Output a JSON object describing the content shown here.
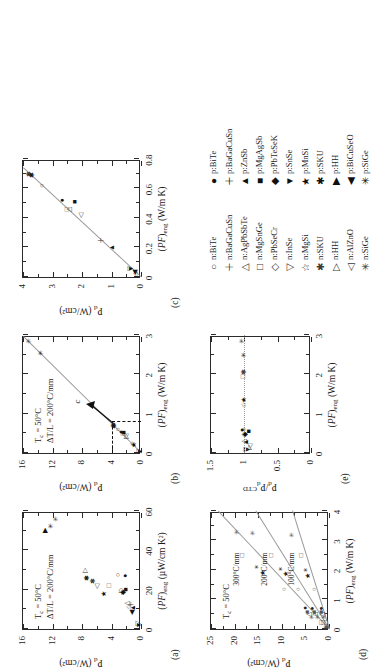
{
  "figure": {
    "caption_panels": [
      "(a)",
      "(b)",
      "(c)",
      "(d)",
      "(e)"
    ]
  },
  "legend": {
    "n_type": [
      {
        "label": "n:BiTe",
        "marker": "circle-open"
      },
      {
        "label": "n:BaGaCuSn",
        "marker": "plus-open"
      },
      {
        "label": "n:AgPbSbTe",
        "marker": "triangle-up-open"
      },
      {
        "label": "n:MgSnGe",
        "marker": "square-open"
      },
      {
        "label": "n:PbSeCr",
        "marker": "diamond-open"
      },
      {
        "label": "n:InSe",
        "marker": "triangle-down-open"
      },
      {
        "label": "n:MgSi",
        "marker": "star5-open"
      },
      {
        "label": "n:SKU",
        "marker": "asterisk-open"
      },
      {
        "label": "n:HH",
        "marker": "triangle-right-open"
      },
      {
        "label": "n:AlZnO",
        "marker": "triangle-left-open"
      },
      {
        "label": "n:SiGe",
        "marker": "star6-open"
      }
    ],
    "p_type": [
      {
        "label": "p:BiTe",
        "marker": "circle-filled"
      },
      {
        "label": "p:BaGaCuSn",
        "marker": "plus-filled"
      },
      {
        "label": "p:ZnSb",
        "marker": "triangle-up-filled"
      },
      {
        "label": "p:MgAgSb",
        "marker": "square-filled"
      },
      {
        "label": "p:PbTeSeK",
        "marker": "diamond-filled"
      },
      {
        "label": "p:SnSe",
        "marker": "triangle-down-filled"
      },
      {
        "label": "p:MnSi",
        "marker": "star5-filled"
      },
      {
        "label": "p:SKU",
        "marker": "asterisk-filled"
      },
      {
        "label": "p:HH",
        "marker": "triangle-right-filled"
      },
      {
        "label": "p:BiCuSeO",
        "marker": "triangle-left-filled"
      },
      {
        "label": "p:SiGe",
        "marker": "star6-filled"
      }
    ]
  },
  "chart_data": [
    {
      "id": "a",
      "panel": "(a)",
      "type": "scatter",
      "title": "",
      "xlabel": "(PF)eng (µW/cm K²)",
      "ylabel": "Pd (W/cm²)",
      "xlabel_parts": {
        "italic": "PF",
        "sub": "eng",
        "unit": "(µW/cm K²)"
      },
      "ylabel_parts": {
        "italic": "P",
        "sub": "d",
        "unit": "(W/cm²)"
      },
      "xlim": [
        0,
        60
      ],
      "ylim": [
        0,
        16
      ],
      "xticks": [
        0,
        20,
        40,
        60
      ],
      "yticks": [
        0,
        4,
        8,
        12,
        16
      ],
      "grid": false,
      "annotations": [
        "Tc = 50°C",
        "ΔT/L = 200°C/mm"
      ],
      "points": [
        {
          "name": "n:BiTe",
          "x": 27.5,
          "y": 3.1,
          "marker": "circle-open"
        },
        {
          "name": "p:BiTe",
          "x": 27.0,
          "y": 2.2,
          "marker": "circle-filled"
        },
        {
          "name": "n:BaGaCuSn",
          "x": 12.5,
          "y": 1.3,
          "marker": "plus-open"
        },
        {
          "name": "p:BaGaCuSn",
          "x": 18.5,
          "y": 2.6,
          "marker": "plus-filled"
        },
        {
          "name": "n:AgPbSbTe",
          "x": 13.0,
          "y": 1.9,
          "marker": "triangle-up-open"
        },
        {
          "name": "p:ZnSb",
          "x": 10.8,
          "y": 1.1,
          "marker": "triangle-up-filled"
        },
        {
          "name": "n:MgSnGe",
          "x": 22.0,
          "y": 4.4,
          "marker": "square-open"
        },
        {
          "name": "p:MgAgSb",
          "x": 20.0,
          "y": 2.1,
          "marker": "square-filled"
        },
        {
          "name": "n:PbSeCr",
          "x": 19.5,
          "y": 2.7,
          "marker": "diamond-open"
        },
        {
          "name": "p:PbTeSeK",
          "x": 18.5,
          "y": 2.5,
          "marker": "diamond-filled"
        },
        {
          "name": "n:InSe",
          "x": 3.0,
          "y": 0.4,
          "marker": "triangle-down-open"
        },
        {
          "name": "p:SnSe",
          "x": 2.0,
          "y": 0.3,
          "marker": "triangle-down-filled"
        },
        {
          "name": "n:MgSi",
          "x": 11.0,
          "y": 1.6,
          "marker": "star5-open"
        },
        {
          "name": "p:MnSi",
          "x": 18.0,
          "y": 5.0,
          "marker": "star5-filled"
        },
        {
          "name": "n:SKU",
          "x": 24.5,
          "y": 6.5,
          "marker": "asterisk-open"
        },
        {
          "name": "p:SKU",
          "x": 26.0,
          "y": 7.3,
          "marker": "asterisk-filled"
        },
        {
          "name": "n:HH",
          "x": 29.5,
          "y": 7.6,
          "marker": "triangle-right-open"
        },
        {
          "name": "p:HH",
          "x": 50.0,
          "y": 13.0,
          "marker": "triangle-right-filled"
        },
        {
          "name": "n:AlZnO",
          "x": 21.5,
          "y": 5.9,
          "marker": "triangle-left-open"
        },
        {
          "name": "p:BiCuSeO",
          "x": 8.5,
          "y": 1.2,
          "marker": "triangle-left-filled"
        },
        {
          "name": "n:SiGe",
          "x": 56.0,
          "y": 11.5,
          "marker": "star6-open"
        },
        {
          "name": "p:SiGe",
          "x": 52.5,
          "y": 12.2,
          "marker": "star6-filled"
        }
      ]
    },
    {
      "id": "b",
      "panel": "(b)",
      "type": "scatter",
      "xlabel": "(PF)eng (W/m K)",
      "ylabel": "Pd (W/cm²)",
      "xlabel_parts": {
        "italic": "PF",
        "sub": "eng",
        "unit": "(W/m K)"
      },
      "ylabel_parts": {
        "italic": "P",
        "sub": "d",
        "unit": "(W/cm²)"
      },
      "xlim": [
        0,
        3
      ],
      "ylim": [
        0,
        16
      ],
      "xticks": [
        0,
        1,
        2,
        3
      ],
      "yticks": [
        0,
        4,
        8,
        12,
        16
      ],
      "grid": false,
      "annotations": [
        "Tc = 50°C",
        "ΔT/L = 200°C/mm",
        "c"
      ],
      "inset_box": {
        "x": [
          0,
          0.8
        ],
        "y": [
          0,
          4
        ],
        "style": "dashed",
        "callout": "c"
      },
      "trendline": {
        "slope": 5.4,
        "intercept": 0.0
      },
      "points": [
        {
          "name": "n:SiGe",
          "x": 2.85,
          "y": 15.2,
          "marker": "star6-open"
        },
        {
          "name": "p:SiGe",
          "x": 2.55,
          "y": 13.6,
          "marker": "star6-filled"
        },
        {
          "name": "n:BiTe",
          "x": 0.6,
          "y": 3.1,
          "marker": "circle-open"
        },
        {
          "name": "p:BiTe",
          "x": 0.53,
          "y": 2.7,
          "marker": "circle-filled"
        },
        {
          "name": "n:MgSnGe",
          "x": 0.5,
          "y": 2.5,
          "marker": "square-open"
        },
        {
          "name": "p:MgAgSb",
          "x": 0.52,
          "y": 2.3,
          "marker": "square-filled"
        },
        {
          "name": "n:SKU",
          "x": 0.7,
          "y": 3.7,
          "marker": "asterisk-open"
        },
        {
          "name": "p:SKU",
          "x": 0.68,
          "y": 3.6,
          "marker": "asterisk-filled"
        },
        {
          "name": "n:HH",
          "x": 0.43,
          "y": 2.0,
          "marker": "triangle-right-open"
        },
        {
          "name": "n:AlZnO",
          "x": 0.42,
          "y": 2.1,
          "marker": "triangle-left-open"
        },
        {
          "name": "n:MgSi",
          "x": 0.22,
          "y": 1.1,
          "marker": "star5-open"
        },
        {
          "name": "p:MnSi",
          "x": 0.2,
          "y": 1.0,
          "marker": "star5-filled"
        },
        {
          "name": "n:InSe",
          "x": 0.05,
          "y": 0.25,
          "marker": "triangle-down-open"
        },
        {
          "name": "p:SnSe",
          "x": 0.04,
          "y": 0.2,
          "marker": "triangle-down-filled"
        }
      ]
    },
    {
      "id": "c",
      "panel": "(c)",
      "type": "scatter",
      "xlabel": "(PF)eng (W/m K)",
      "ylabel": "Pd (W/cm²)",
      "xlabel_parts": {
        "italic": "PF",
        "sub": "eng",
        "unit": "(W/m K)"
      },
      "ylabel_parts": {
        "italic": "P",
        "sub": "d",
        "unit": "(W/cm²)"
      },
      "xlim": [
        0,
        0.8
      ],
      "ylim": [
        0,
        4
      ],
      "xticks": [
        0,
        0.2,
        0.4,
        0.6,
        0.8
      ],
      "xticklabels": [
        "0",
        "0.2",
        "0.4",
        "0.6",
        "0.8"
      ],
      "yticks": [
        0,
        1,
        2,
        3,
        4
      ],
      "grid": false,
      "trendline": {
        "slope": 5.4,
        "intercept": 0.0
      },
      "points": [
        {
          "name": "n:SKU",
          "x": 0.7,
          "y": 3.8,
          "marker": "asterisk-open"
        },
        {
          "name": "p:SKU",
          "x": 0.69,
          "y": 3.7,
          "marker": "asterisk-filled"
        },
        {
          "name": "n:BiTe",
          "x": 0.62,
          "y": 3.35,
          "marker": "circle-open"
        },
        {
          "name": "p:BiTe",
          "x": 0.52,
          "y": 2.68,
          "marker": "circle-filled"
        },
        {
          "name": "p:MgAgSb",
          "x": 0.51,
          "y": 2.25,
          "marker": "square-filled"
        },
        {
          "name": "n:MgSnGe",
          "x": 0.46,
          "y": 2.5,
          "marker": "square-open"
        },
        {
          "name": "n:AgPbSbTe",
          "x": 0.455,
          "y": 2.45,
          "marker": "triangle-up-open"
        },
        {
          "name": "n:AlZnO",
          "x": 0.42,
          "y": 2.05,
          "marker": "triangle-left-open"
        },
        {
          "name": "n:BaGaCuSn",
          "x": 0.25,
          "y": 1.35,
          "marker": "plus-open"
        },
        {
          "name": "p:ZnSb",
          "x": 0.2,
          "y": 0.98,
          "marker": "triangle-up-filled"
        },
        {
          "name": "n:InSe",
          "x": 0.06,
          "y": 0.38,
          "marker": "triangle-down-open"
        },
        {
          "name": "p:SnSe",
          "x": 0.055,
          "y": 0.35,
          "marker": "triangle-down-filled"
        },
        {
          "name": "p:BiCuSeO",
          "x": 0.03,
          "y": 0.22,
          "marker": "triangle-left-filled"
        },
        {
          "name": "n:MgSi",
          "x": 0.02,
          "y": 0.18,
          "marker": "star5-open"
        }
      ]
    },
    {
      "id": "d",
      "panel": "(d)",
      "type": "scatter",
      "xlabel": "(PF)eng (W/m K)",
      "ylabel": "Pd (W/cm²)",
      "xlabel_parts": {
        "italic": "PF",
        "sub": "eng",
        "unit": "(W/m K)"
      },
      "ylabel_parts": {
        "italic": "P",
        "sub": "d",
        "unit": "(W/cm²)"
      },
      "xlim": [
        0,
        4
      ],
      "ylim": [
        0,
        25
      ],
      "xticks": [
        0,
        1,
        2,
        3,
        4
      ],
      "yticks": [
        0,
        5,
        10,
        15,
        20,
        25
      ],
      "grid": false,
      "annotations": [
        "Tc = 50°C"
      ],
      "series_labels": [
        "300°C/mm",
        "200°C/mm",
        "100°C/mm"
      ],
      "series": [
        {
          "name": "300°C/mm",
          "slope": 5.9,
          "points": [
            {
              "x": 3.3,
              "y": 19.5
            },
            {
              "x": 2.5,
              "y": 18.5
            },
            {
              "x": 2.1,
              "y": 15.2
            },
            {
              "x": 1.9,
              "y": 14.0
            },
            {
              "x": 1.35,
              "y": 9.6
            },
            {
              "x": 0.72,
              "y": 5.0
            },
            {
              "x": 0.58,
              "y": 4.6
            },
            {
              "x": 0.5,
              "y": 4.2
            },
            {
              "x": 0.42,
              "y": 3.5
            },
            {
              "x": 0.22,
              "y": 1.8
            },
            {
              "x": 0.08,
              "y": 0.6
            }
          ]
        },
        {
          "name": "200°C/mm",
          "slope": 3.9,
          "points": [
            {
              "x": 3.25,
              "y": 16.0
            },
            {
              "x": 2.5,
              "y": 12.3
            },
            {
              "x": 2.05,
              "y": 10.1
            },
            {
              "x": 1.85,
              "y": 9.2
            },
            {
              "x": 1.35,
              "y": 6.6
            },
            {
              "x": 0.7,
              "y": 3.5
            },
            {
              "x": 0.58,
              "y": 3.2
            },
            {
              "x": 0.5,
              "y": 2.9
            },
            {
              "x": 0.42,
              "y": 2.4
            },
            {
              "x": 0.22,
              "y": 1.2
            },
            {
              "x": 0.08,
              "y": 0.4
            }
          ]
        },
        {
          "name": "100°C/mm",
          "slope": 1.95,
          "points": [
            {
              "x": 3.2,
              "y": 7.8
            },
            {
              "x": 2.5,
              "y": 6.0
            },
            {
              "x": 2.0,
              "y": 4.8
            },
            {
              "x": 1.8,
              "y": 4.4
            },
            {
              "x": 1.35,
              "y": 3.2
            },
            {
              "x": 0.7,
              "y": 1.8
            },
            {
              "x": 0.58,
              "y": 1.6
            },
            {
              "x": 0.5,
              "y": 1.4
            },
            {
              "x": 0.42,
              "y": 1.1
            },
            {
              "x": 0.22,
              "y": 0.6
            },
            {
              "x": 0.08,
              "y": 0.2
            }
          ]
        }
      ]
    },
    {
      "id": "e",
      "panel": "(e)",
      "type": "scatter",
      "xlabel": "(PF)eng (W/m K)",
      "ylabel": "Pd/PdCTD",
      "xlabel_parts": {
        "italic": "PF",
        "sub": "eng",
        "unit": "(W/m K)"
      },
      "ylabel_parts": {
        "italic": "P",
        "sub": "d",
        "unit": "/P",
        "sub2": "d",
        "sup": "CTD"
      },
      "xlim": [
        0,
        3
      ],
      "ylim": [
        0,
        1.5
      ],
      "xticks": [
        0,
        1,
        2,
        3
      ],
      "yticks": [
        0,
        0.5,
        1,
        1.5
      ],
      "yticklabels": [
        "0",
        "0.5",
        "1",
        "1.5"
      ],
      "grid": false,
      "reference_line": 1.0,
      "points": [
        {
          "name": "n:SiGe",
          "x": 2.85,
          "y": 1.04,
          "marker": "star6-open"
        },
        {
          "name": "p:SiGe",
          "x": 2.5,
          "y": 1.0,
          "marker": "star6-filled"
        },
        {
          "name": "n:SKU",
          "x": 2.05,
          "y": 1.0,
          "marker": "asterisk-open"
        },
        {
          "name": "n:MgSnGe",
          "x": 1.95,
          "y": 1.02,
          "marker": "square-open"
        },
        {
          "name": "p:MnSi",
          "x": 1.35,
          "y": 1.0,
          "marker": "star5-filled"
        },
        {
          "name": "n:MgSi",
          "x": 1.22,
          "y": 1.01,
          "marker": "star5-open"
        },
        {
          "name": "n:BiTe",
          "x": 0.6,
          "y": 1.0,
          "marker": "circle-open"
        },
        {
          "name": "p:BiTe",
          "x": 0.58,
          "y": 1.03,
          "marker": "circle-filled"
        },
        {
          "name": "p:MgAgSb",
          "x": 0.55,
          "y": 0.93,
          "marker": "square-filled"
        },
        {
          "name": "n:PbSeCr",
          "x": 0.48,
          "y": 1.0,
          "marker": "diamond-open"
        },
        {
          "name": "p:PbTeSeK",
          "x": 0.46,
          "y": 0.99,
          "marker": "diamond-filled"
        },
        {
          "name": "n:AgPbSbTe",
          "x": 0.3,
          "y": 1.0,
          "marker": "triangle-up-open"
        },
        {
          "name": "p:ZnSb",
          "x": 0.28,
          "y": 0.98,
          "marker": "triangle-up-filled"
        },
        {
          "name": "n:InSe",
          "x": 0.1,
          "y": 0.97,
          "marker": "triangle-down-open"
        },
        {
          "name": "p:SnSe",
          "x": 0.09,
          "y": 0.95,
          "marker": "triangle-down-filled"
        },
        {
          "name": "n:HH",
          "x": 0.14,
          "y": 0.93,
          "marker": "triangle-right-open"
        },
        {
          "name": "n:AlZnO",
          "x": 0.16,
          "y": 0.92,
          "marker": "triangle-left-open"
        }
      ]
    }
  ]
}
